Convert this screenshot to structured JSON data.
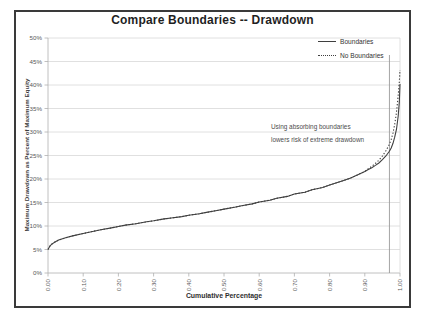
{
  "chart": {
    "title": "Compare Boundaries -- Drawdown",
    "x_axis_title": "Cumulative Percentage",
    "y_axis_title": "Maximum Drawdown as Percent of Maximum Equity",
    "legend": {
      "items": [
        {
          "label": "Boundaries",
          "style": "solid"
        },
        {
          "label": "No Boundaries",
          "style": "dotted"
        }
      ]
    },
    "annotation": {
      "line1": "Using absorbing boundaries",
      "line2": "lowers risk of extreme drawdown"
    },
    "colors": {
      "frame_border": "#3a3a3a",
      "gridline": "#d8d8d8",
      "axis_line": "#b0b0b0",
      "tick": "#b0b0b0",
      "marker_line": "#9b9b9b",
      "series_line": "#3f3f3f",
      "tick_text": "#595959"
    }
  },
  "chart_data": {
    "type": "line",
    "title": "Compare Boundaries -- Drawdown",
    "xlabel": "Cumulative Percentage",
    "ylabel": "Maximum Drawdown as Percent of Maximum Equity",
    "xlim": [
      0,
      1
    ],
    "ylim": [
      0,
      50
    ],
    "grid": true,
    "legend_position": "top-right",
    "x_tick_labels": [
      "0.00",
      "0.10",
      "0.20",
      "0.30",
      "0.40",
      "0.50",
      "0.60",
      "0.70",
      "0.80",
      "0.90",
      "1.00"
    ],
    "x_tick_values": [
      0,
      0.1,
      0.2,
      0.3,
      0.4,
      0.5,
      0.6,
      0.7,
      0.8,
      0.9,
      1.0
    ],
    "y_tick_labels": [
      "0%",
      "5%",
      "10%",
      "15%",
      "20%",
      "25%",
      "30%",
      "35%",
      "40%",
      "45%",
      "50%"
    ],
    "y_tick_values": [
      0,
      5,
      10,
      15,
      20,
      25,
      30,
      35,
      40,
      45,
      50
    ],
    "marker_line_x": 0.97,
    "series": [
      {
        "name": "Boundaries",
        "line_style": "solid",
        "points": [
          [
            0.0,
            5.0
          ],
          [
            0.005,
            5.7
          ],
          [
            0.01,
            6.1
          ],
          [
            0.02,
            6.6
          ],
          [
            0.03,
            7.0
          ],
          [
            0.05,
            7.5
          ],
          [
            0.07,
            7.9
          ],
          [
            0.1,
            8.4
          ],
          [
            0.13,
            8.9
          ],
          [
            0.15,
            9.2
          ],
          [
            0.18,
            9.6
          ],
          [
            0.2,
            9.9
          ],
          [
            0.22,
            10.2
          ],
          [
            0.25,
            10.5
          ],
          [
            0.28,
            10.9
          ],
          [
            0.3,
            11.1
          ],
          [
            0.33,
            11.5
          ],
          [
            0.35,
            11.7
          ],
          [
            0.38,
            12.0
          ],
          [
            0.4,
            12.3
          ],
          [
            0.43,
            12.6
          ],
          [
            0.45,
            12.9
          ],
          [
            0.48,
            13.3
          ],
          [
            0.5,
            13.6
          ],
          [
            0.53,
            14.0
          ],
          [
            0.55,
            14.3
          ],
          [
            0.58,
            14.7
          ],
          [
            0.6,
            15.1
          ],
          [
            0.63,
            15.5
          ],
          [
            0.65,
            15.9
          ],
          [
            0.68,
            16.3
          ],
          [
            0.7,
            16.8
          ],
          [
            0.73,
            17.2
          ],
          [
            0.75,
            17.7
          ],
          [
            0.78,
            18.2
          ],
          [
            0.8,
            18.7
          ],
          [
            0.82,
            19.2
          ],
          [
            0.84,
            19.7
          ],
          [
            0.86,
            20.2
          ],
          [
            0.88,
            20.9
          ],
          [
            0.9,
            21.6
          ],
          [
            0.91,
            22.0
          ],
          [
            0.92,
            22.4
          ],
          [
            0.93,
            22.9
          ],
          [
            0.94,
            23.4
          ],
          [
            0.95,
            24.1
          ],
          [
            0.96,
            24.9
          ],
          [
            0.97,
            25.9
          ],
          [
            0.975,
            26.6
          ],
          [
            0.98,
            27.6
          ],
          [
            0.985,
            28.9
          ],
          [
            0.99,
            30.6
          ],
          [
            0.995,
            33.4
          ],
          [
            0.998,
            36.3
          ],
          [
            1.0,
            40.2
          ]
        ]
      },
      {
        "name": "No Boundaries",
        "line_style": "dotted",
        "points": [
          [
            0.0,
            5.0
          ],
          [
            0.005,
            5.7
          ],
          [
            0.01,
            6.1
          ],
          [
            0.02,
            6.6
          ],
          [
            0.03,
            7.0
          ],
          [
            0.05,
            7.5
          ],
          [
            0.07,
            7.9
          ],
          [
            0.1,
            8.4
          ],
          [
            0.13,
            8.9
          ],
          [
            0.15,
            9.2
          ],
          [
            0.18,
            9.6
          ],
          [
            0.2,
            9.9
          ],
          [
            0.22,
            10.2
          ],
          [
            0.25,
            10.5
          ],
          [
            0.28,
            10.9
          ],
          [
            0.3,
            11.1
          ],
          [
            0.33,
            11.5
          ],
          [
            0.35,
            11.7
          ],
          [
            0.38,
            12.0
          ],
          [
            0.4,
            12.3
          ],
          [
            0.43,
            12.6
          ],
          [
            0.45,
            12.9
          ],
          [
            0.48,
            13.3
          ],
          [
            0.5,
            13.6
          ],
          [
            0.53,
            14.0
          ],
          [
            0.55,
            14.3
          ],
          [
            0.58,
            14.7
          ],
          [
            0.6,
            15.1
          ],
          [
            0.63,
            15.5
          ],
          [
            0.65,
            15.9
          ],
          [
            0.68,
            16.3
          ],
          [
            0.7,
            16.8
          ],
          [
            0.73,
            17.2
          ],
          [
            0.75,
            17.7
          ],
          [
            0.78,
            18.2
          ],
          [
            0.8,
            18.7
          ],
          [
            0.82,
            19.2
          ],
          [
            0.84,
            19.7
          ],
          [
            0.86,
            20.2
          ],
          [
            0.88,
            20.9
          ],
          [
            0.9,
            21.6
          ],
          [
            0.91,
            22.2
          ],
          [
            0.92,
            22.7
          ],
          [
            0.93,
            23.3
          ],
          [
            0.94,
            24.0
          ],
          [
            0.95,
            24.9
          ],
          [
            0.96,
            26.0
          ],
          [
            0.97,
            27.4
          ],
          [
            0.975,
            28.4
          ],
          [
            0.98,
            29.8
          ],
          [
            0.985,
            31.6
          ],
          [
            0.99,
            34.2
          ],
          [
            0.995,
            37.8
          ],
          [
            0.998,
            40.6
          ],
          [
            1.0,
            43.2
          ]
        ]
      }
    ]
  }
}
